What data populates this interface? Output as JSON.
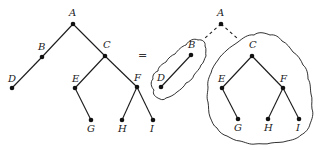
{
  "diagram": {
    "type": "tree-decomposition",
    "equals_sign": "=",
    "left_tree": {
      "nodes": [
        {
          "id": "A",
          "label": "A",
          "x": 73,
          "y": 24
        },
        {
          "id": "B",
          "label": "B",
          "x": 42,
          "y": 57
        },
        {
          "id": "C",
          "label": "C",
          "x": 105,
          "y": 56
        },
        {
          "id": "D",
          "label": "D",
          "x": 12,
          "y": 88
        },
        {
          "id": "E",
          "label": "E",
          "x": 75,
          "y": 88
        },
        {
          "id": "F",
          "label": "F",
          "x": 137,
          "y": 87
        },
        {
          "id": "G",
          "label": "G",
          "x": 91,
          "y": 120
        },
        {
          "id": "H",
          "label": "H",
          "x": 122,
          "y": 120
        },
        {
          "id": "I",
          "label": "I",
          "x": 153,
          "y": 120
        }
      ],
      "edges": [
        [
          "A",
          "B"
        ],
        [
          "A",
          "C"
        ],
        [
          "B",
          "D"
        ],
        [
          "C",
          "E"
        ],
        [
          "C",
          "F"
        ],
        [
          "E",
          "G"
        ],
        [
          "F",
          "H"
        ],
        [
          "F",
          "I"
        ]
      ]
    },
    "right_tree": {
      "root": {
        "id": "A",
        "label": "A",
        "x": 221,
        "y": 24
      },
      "left_subtree": {
        "nodes": [
          {
            "id": "B",
            "label": "B",
            "x": 191,
            "y": 55
          },
          {
            "id": "D",
            "label": "D",
            "x": 161,
            "y": 87
          }
        ],
        "edges": [
          [
            "B",
            "D"
          ]
        ]
      },
      "right_subtree": {
        "nodes": [
          {
            "id": "C",
            "label": "C",
            "x": 252,
            "y": 56
          },
          {
            "id": "E",
            "label": "E",
            "x": 222,
            "y": 88
          },
          {
            "id": "F",
            "label": "F",
            "x": 283,
            "y": 88
          },
          {
            "id": "G",
            "label": "G",
            "x": 238,
            "y": 119
          },
          {
            "id": "H",
            "label": "H",
            "x": 268,
            "y": 119
          },
          {
            "id": "I",
            "label": "I",
            "x": 299,
            "y": 119
          }
        ],
        "edges": [
          [
            "C",
            "E"
          ],
          [
            "C",
            "F"
          ],
          [
            "E",
            "G"
          ],
          [
            "F",
            "H"
          ],
          [
            "F",
            "I"
          ]
        ]
      }
    }
  }
}
